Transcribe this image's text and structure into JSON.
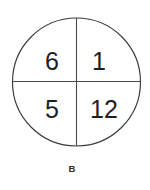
{
  "figure": {
    "label": "B",
    "shape": "circle-divided-into-quadrants",
    "geometry": {
      "center_x": 76.5,
      "center_y": 82,
      "radius": 64,
      "vertical_divider_x": 76.5,
      "horizontal_divider_y": 81.5
    },
    "colors": {
      "background": "#ffffff",
      "outline": "#3a3a3a",
      "divider": "#4a4a4a",
      "number": "#1f1f1f",
      "caption": "#2a2a2a"
    },
    "quadrants": [
      {
        "position": "top-left",
        "value": "6",
        "x": 52,
        "y": 62
      },
      {
        "position": "top-right",
        "value": "1",
        "x": 99,
        "y": 62
      },
      {
        "position": "bottom-left",
        "value": "5",
        "x": 52,
        "y": 110
      },
      {
        "position": "bottom-right",
        "value": "12",
        "x": 104,
        "y": 110
      }
    ],
    "caption": {
      "text": "B",
      "x": 72,
      "y": 169
    }
  }
}
